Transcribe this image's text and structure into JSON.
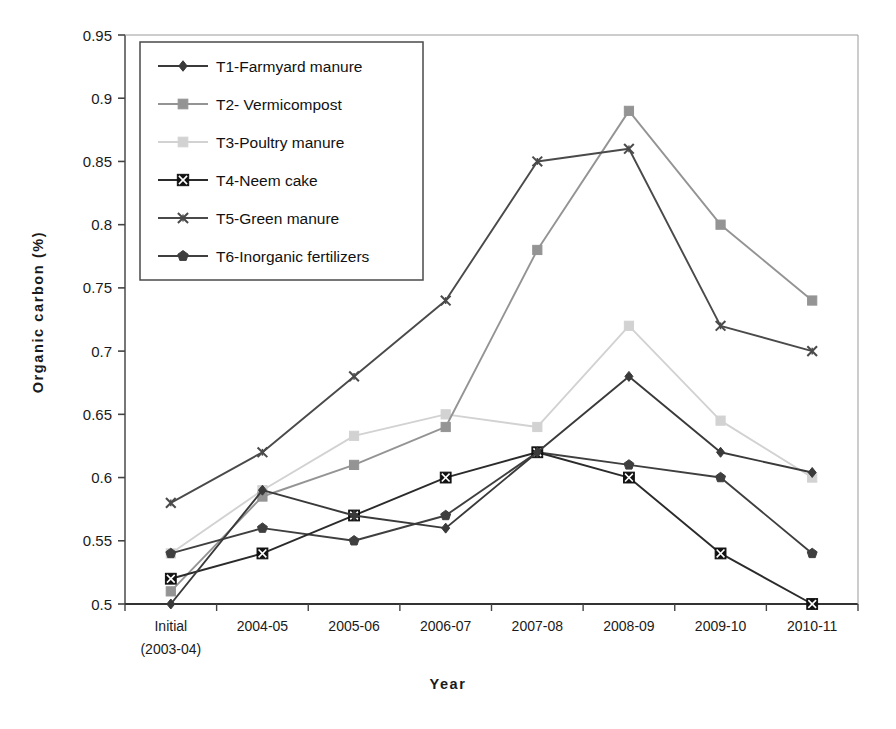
{
  "chart_data": {
    "type": "line",
    "title": "",
    "xlabel": "Year",
    "ylabel": "Organic carbon (%)",
    "ylim": [
      0.5,
      0.95
    ],
    "yticks": [
      "0.5",
      "0.55",
      "0.6",
      "0.65",
      "0.7",
      "0.75",
      "0.8",
      "0.85",
      "0.9",
      "0.95"
    ],
    "ytick_values": [
      0.5,
      0.55,
      0.6,
      0.65,
      0.7,
      0.75,
      0.8,
      0.85,
      0.9,
      0.95
    ],
    "grid": false,
    "legend_position": "upper-left",
    "categories": [
      "Initial\n(2003-04)",
      "2004-05",
      "2005-06",
      "2006-07",
      "2007-08",
      "2008-09",
      "2009-10",
      "2010-11"
    ],
    "category_labels": [
      {
        "line1": "Initial",
        "line2": "(2003-04)"
      },
      {
        "line1": "2004-05",
        "line2": ""
      },
      {
        "line1": "2005-06",
        "line2": ""
      },
      {
        "line1": "2006-07",
        "line2": ""
      },
      {
        "line1": "2007-08",
        "line2": ""
      },
      {
        "line1": "2008-09",
        "line2": ""
      },
      {
        "line1": "2009-10",
        "line2": ""
      },
      {
        "line1": "2010-11",
        "line2": ""
      }
    ],
    "series": [
      {
        "name": "T1-Farmyard manure",
        "marker": "diamond",
        "color": "#3a3a3a",
        "values": [
          0.5,
          0.59,
          0.57,
          0.56,
          0.62,
          0.68,
          0.62,
          0.604
        ]
      },
      {
        "name": "T2- Vermicompost",
        "marker": "square",
        "color": "#949494",
        "values": [
          0.51,
          0.585,
          0.61,
          0.64,
          0.78,
          0.89,
          0.8,
          0.74
        ]
      },
      {
        "name": "T3-Poultry manure",
        "marker": "square",
        "color": "#d2d2d2",
        "values": [
          0.54,
          0.59,
          0.633,
          0.65,
          0.64,
          0.72,
          0.645,
          0.6
        ]
      },
      {
        "name": "T4-Neem cake",
        "marker": "boxx",
        "color": "#2b2b2b",
        "values": [
          0.52,
          0.54,
          0.57,
          0.6,
          0.62,
          0.6,
          0.54,
          0.5
        ]
      },
      {
        "name": "T5-Green manure",
        "marker": "star",
        "color": "#4a4a4a",
        "values": [
          0.58,
          0.62,
          0.68,
          0.74,
          0.85,
          0.86,
          0.72,
          0.7
        ]
      },
      {
        "name": "T6-Inorganic fertilizers",
        "marker": "pentagon",
        "color": "#3f3f3f",
        "values": [
          0.54,
          0.56,
          0.55,
          0.57,
          0.62,
          0.61,
          0.6,
          0.54
        ]
      }
    ]
  },
  "legend": {
    "items": [
      {
        "label": "T1-Farmyard manure"
      },
      {
        "label": "T2- Vermicompost"
      },
      {
        "label": "T3-Poultry manure"
      },
      {
        "label": "T4-Neem cake"
      },
      {
        "label": "T5-Green manure"
      },
      {
        "label": "T6-Inorganic fertilizers"
      }
    ]
  },
  "axes": {
    "y_title": "Organic carbon (%)",
    "x_title": "Year"
  }
}
